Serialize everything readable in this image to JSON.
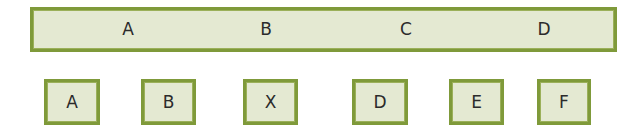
{
  "colors": {
    "border": "#7f9a3a",
    "fill": "#e4e9d2",
    "text": "#2b2b2b"
  },
  "bar": {
    "items": [
      {
        "label": "A",
        "x": 95
      },
      {
        "label": "B",
        "x": 233
      },
      {
        "label": "C",
        "x": 373
      },
      {
        "label": "D",
        "x": 511
      }
    ]
  },
  "boxes": [
    {
      "label": "A",
      "left": 44,
      "width": 56
    },
    {
      "label": "B",
      "left": 141,
      "width": 55
    },
    {
      "label": "X",
      "left": 243,
      "width": 55
    },
    {
      "label": "D",
      "left": 352,
      "width": 56
    },
    {
      "label": "E",
      "left": 449,
      "width": 55
    },
    {
      "label": "F",
      "left": 537,
      "width": 54
    }
  ]
}
